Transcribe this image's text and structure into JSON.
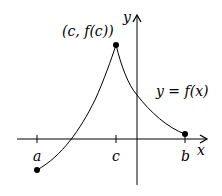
{
  "diagram": {
    "title": "",
    "axes": {
      "x_label": "x",
      "y_label": "y"
    },
    "points": {
      "a": {
        "label": "a"
      },
      "b": {
        "label": "b"
      },
      "c": {
        "label": "c"
      },
      "peak": {
        "label": "(c, f(c))"
      }
    },
    "curve_label": "y = f(x)",
    "colors": {
      "stroke": "#000000",
      "background": "#ffffff"
    }
  }
}
